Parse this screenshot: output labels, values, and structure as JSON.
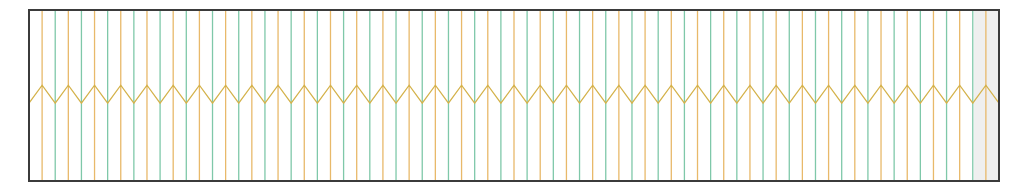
{
  "figure": {
    "background_color": "#ffffff",
    "width": 1022,
    "height": 192
  },
  "chart_data": {
    "type": "line",
    "title": "",
    "subtitle": "",
    "xlabel": "",
    "ylabel": "",
    "grid": false,
    "legend": null,
    "axis": {
      "frame_color": "#3b3b3b",
      "frame_line_width": 2.0,
      "plot_left_px": 29,
      "plot_top_px": 10,
      "plot_right_px": 999,
      "plot_bottom_px": 181,
      "xlim": [
        0,
        74
      ],
      "ylim": [
        0,
        1
      ],
      "xticks": [],
      "yticks": [],
      "xtick_labels": [],
      "ytick_labels": []
    },
    "shaded_region": {
      "name": "right-shaded-band",
      "color": "#e2e2e2",
      "opacity": 0.55,
      "x_start": 72.1,
      "x_end": 74.0
    },
    "series": [
      {
        "name": "vertical-lines-teal",
        "type": "vlines",
        "color": "#7fc8a9",
        "line_width": 1.3,
        "description": "vertical lines spanning full plot height at even indices",
        "x_start_index": 0,
        "x_step": 2,
        "count": 37,
        "y_bottom": 0,
        "y_top": 1
      },
      {
        "name": "vertical-lines-orange",
        "type": "vlines",
        "color": "#e8b96a",
        "line_width": 1.3,
        "description": "vertical lines spanning full plot height at odd indices",
        "x_start_index": 1,
        "x_step": 2,
        "count": 37,
        "y_bottom": 0,
        "y_top": 1
      },
      {
        "name": "zigzag-line",
        "type": "line",
        "color": "#d4b24a",
        "line_width": 1.3,
        "description": "sawtooth/zigzag polyline; peaks coincide with orange vertical lines, valleys with teal vertical lines",
        "peak_y": 0.56,
        "valley_y": 0.455,
        "peak_at": "orange-lines",
        "valley_at": "teal-lines",
        "point_count": 75
      }
    ],
    "n_vertical_lines_total": 74,
    "vertical_line_spacing_px": 13.1,
    "colors": {
      "teal": "#7fc8a9",
      "orange": "#e8b96a",
      "zigzag": "#d4b24a",
      "frame": "#3b3b3b",
      "shade": "#e2e2e2",
      "background": "#ffffff"
    }
  }
}
